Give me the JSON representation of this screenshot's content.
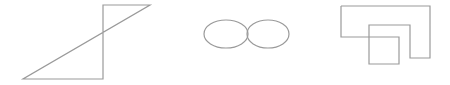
{
  "canvas": {
    "width": 450,
    "height": 85,
    "background": "#ffffff"
  },
  "stroke": {
    "color": "#9a9a9a",
    "width": 1.2
  },
  "shapes": [
    {
      "name": "z-polygon",
      "type": "polygon",
      "points": "23,79 103,79 103,5 150,5"
    },
    {
      "name": "left-ellipse",
      "type": "ellipse",
      "cx": 226,
      "cy": 34,
      "rx": 22,
      "ry": 14
    },
    {
      "name": "right-ellipse",
      "type": "ellipse",
      "cx": 268,
      "cy": 34,
      "rx": 21,
      "ry": 14
    },
    {
      "name": "nested-rect-outline",
      "type": "polyline",
      "points": "341,6 430,6 430,58 410,58 410,25 369,25 369,64 399,64 399,37 341,37 341,6"
    }
  ]
}
